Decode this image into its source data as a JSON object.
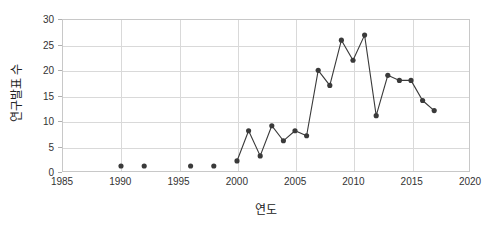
{
  "chart_data": {
    "type": "line",
    "title": "",
    "xlabel": "연도",
    "ylabel": "연구발표 수",
    "xlim": [
      1985,
      2020
    ],
    "ylim": [
      0,
      30
    ],
    "grid": true,
    "legend": "none",
    "xticks": [
      1985,
      1990,
      1995,
      2000,
      2005,
      2010,
      2015,
      2020
    ],
    "yticks": [
      0,
      5,
      10,
      15,
      20,
      25,
      30
    ],
    "marker": "circle",
    "marker_color": "#3a3a3a",
    "line_color": "#3a3a3a",
    "gridline_color": "#d9d9d9",
    "border_color": "#c8c8c8",
    "background_color": "#ffffff",
    "series": [
      {
        "name": "isolated-points",
        "connected": false,
        "x": [
          1990,
          1992,
          1996,
          1998
        ],
        "values": [
          1,
          1,
          1,
          1
        ]
      },
      {
        "name": "main-series",
        "connected": true,
        "x": [
          2000,
          2001,
          2002,
          2003,
          2004,
          2005,
          2006,
          2007,
          2008,
          2009,
          2010,
          2011,
          2012,
          2013,
          2014,
          2015,
          2016,
          2017
        ],
        "values": [
          2,
          8,
          3,
          9,
          6,
          8,
          7,
          20,
          17,
          26,
          22,
          27,
          11,
          19,
          18,
          18,
          14,
          12
        ]
      }
    ]
  }
}
